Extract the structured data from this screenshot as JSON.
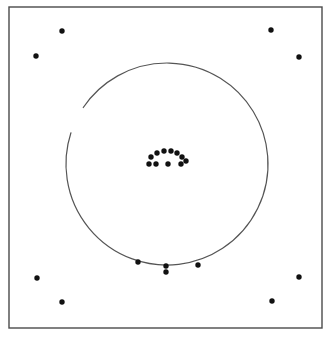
{
  "figure": {
    "canvas": {
      "width": 331,
      "height": 340,
      "background": "#ffffff"
    },
    "frame": {
      "name": "outer-border-rectangle",
      "x": 9,
      "y": 7,
      "width": 313,
      "height": 321,
      "stroke_color": "#4a4a4a",
      "stroke_width": 1.4,
      "fill": "none"
    },
    "circle": {
      "name": "large-circle-arc",
      "center_x": 167,
      "center_y": 164,
      "radius": 101,
      "stroke_color": "#555555",
      "stroke_width": 1.2,
      "fill": "none",
      "gap_start_deg": 198,
      "gap_end_deg": 214,
      "gap_note": "open break on the lower-left side of the circle"
    },
    "dot_style": {
      "radius": 2.7,
      "fill_color": "#111111"
    }
  },
  "chart_data": {
    "type": "scatter",
    "xlabel": "",
    "ylabel": "",
    "xlim": [
      9,
      322
    ],
    "ylim": [
      7,
      328
    ],
    "grid": false,
    "legend": "none",
    "annotations": [
      {
        "name": "circle-overlay",
        "shape": "circle",
        "center": [
          167,
          164
        ],
        "radius": 101,
        "open_arc_from_deg": 198,
        "open_arc_to_deg": 214
      },
      {
        "name": "plot-frame",
        "shape": "rectangle",
        "x": 9,
        "y": 7,
        "width": 313,
        "height": 321
      }
    ],
    "groups": [
      {
        "name": "corner-points",
        "count": 8,
        "points": [
          {
            "id": "corner-tl-inner",
            "x": 62,
            "y": 31
          },
          {
            "id": "corner-tl-outer",
            "x": 36,
            "y": 56
          },
          {
            "id": "corner-tr-inner",
            "x": 271,
            "y": 30
          },
          {
            "id": "corner-tr-outer",
            "x": 299,
            "y": 57
          },
          {
            "id": "corner-bl-outer",
            "x": 37,
            "y": 278
          },
          {
            "id": "corner-bl-inner",
            "x": 62,
            "y": 302
          },
          {
            "id": "corner-br-outer",
            "x": 299,
            "y": 277
          },
          {
            "id": "corner-br-inner",
            "x": 272,
            "y": 301
          }
        ]
      },
      {
        "name": "central-arch-cluster",
        "count": 11,
        "points": [
          {
            "id": "arch-top-1",
            "x": 151,
            "y": 157
          },
          {
            "id": "arch-top-2",
            "x": 157,
            "y": 153
          },
          {
            "id": "arch-top-3",
            "x": 164,
            "y": 151
          },
          {
            "id": "arch-top-4",
            "x": 171,
            "y": 151
          },
          {
            "id": "arch-top-5",
            "x": 177,
            "y": 153
          },
          {
            "id": "arch-top-6",
            "x": 182,
            "y": 157
          },
          {
            "id": "arch-top-7",
            "x": 186,
            "y": 161
          },
          {
            "id": "arch-low-1",
            "x": 149,
            "y": 164
          },
          {
            "id": "arch-low-2",
            "x": 156,
            "y": 164
          },
          {
            "id": "arch-low-3",
            "x": 168,
            "y": 164
          },
          {
            "id": "arch-low-4",
            "x": 181,
            "y": 164
          }
        ]
      },
      {
        "name": "lower-arc-points",
        "count": 4,
        "points": [
          {
            "id": "arc-pt-left",
            "x": 138,
            "y": 262
          },
          {
            "id": "arc-pt-mid-upper",
            "x": 166,
            "y": 266
          },
          {
            "id": "arc-pt-mid-lower",
            "x": 166,
            "y": 272
          },
          {
            "id": "arc-pt-right",
            "x": 198,
            "y": 265
          }
        ]
      }
    ]
  }
}
